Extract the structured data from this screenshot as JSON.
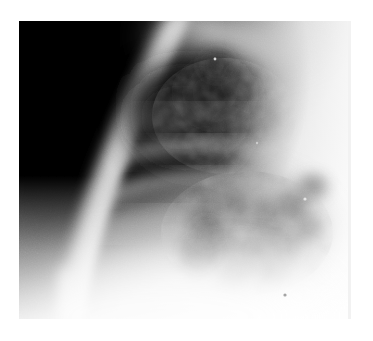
{
  "page": {
    "background_color": "#ffffff",
    "width": 373,
    "height": 341
  },
  "radiograph": {
    "modality": "chest-radiograph",
    "view": "lateral-oblique",
    "colorspace": "grayscale",
    "frame": {
      "x": 19,
      "y": 21,
      "width": 332,
      "height": 298
    },
    "border_color": "#f2f2f2",
    "tones": {
      "air_black": "#050505",
      "deep_shadow": "#1a1a1a",
      "lung_dark": "#2e2e2e",
      "mid_gray": "#7d7d7d",
      "soft_tissue": "#b5b5b5",
      "bone_bright": "#d8d8d8",
      "diaphragm_white": "#f0f0f0",
      "paper_white": "#ffffff"
    },
    "regions": [
      {
        "name": "air-field-upper-left",
        "tone": "#050505",
        "description": "dense black unexposed / air region occupying the upper-left quadrant"
      },
      {
        "name": "bone-arc-humerus-scapula",
        "tone": "#cfcfcf",
        "description": "bright curved radiopaque band sweeping from top-center down to lower-left"
      },
      {
        "name": "lung-field-dark-central",
        "tone": "#2a2a2a",
        "description": "darker aerated lung field right of the bone arc with rib shadows"
      },
      {
        "name": "rib-shadow-bands",
        "tone": "#8a8a8a",
        "description": "diagonal lighter rib bands crossing the mid field"
      },
      {
        "name": "nodular-opacity-cluster",
        "tone": "#3d3d3d",
        "description": "mottled reticulonodular opacities clustered in the right-central field"
      },
      {
        "name": "hilar-dense-mass",
        "tone": "#262626",
        "description": "confluent dark density just left of the nodular cluster"
      },
      {
        "name": "soft-tissue-right-margin",
        "tone": "#e2e2e2",
        "description": "bright soft tissue / chest wall along the right margin"
      },
      {
        "name": "diaphragm-abdomen-lower",
        "tone": "#f2f2f2",
        "description": "bright white diaphragm and sub-diaphragmatic region across the lower field"
      }
    ]
  }
}
